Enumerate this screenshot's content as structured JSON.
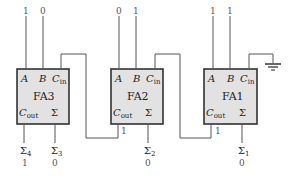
{
  "adders": [
    {
      "id": "FA3",
      "title": "FA3",
      "inputs": {
        "A": "1",
        "B": "0"
      },
      "pins": {
        "a": "A",
        "b": "B",
        "cin": "C",
        "cin_sub": "in",
        "cout": "C",
        "cout_sub": "out",
        "sum": "Σ"
      },
      "outputs": {
        "cout_label": "Σ",
        "cout_sub": "4",
        "cout_value": "1",
        "sum_label": "Σ",
        "sum_sub": "3",
        "sum_value": "0"
      }
    },
    {
      "id": "FA2",
      "title": "FA2",
      "inputs": {
        "A": "0",
        "B": "1"
      },
      "pins": {
        "a": "A",
        "b": "B",
        "cin": "C",
        "cin_sub": "in",
        "cout": "C",
        "cout_sub": "out",
        "sum": "Σ"
      },
      "outputs": {
        "carry_value": "1",
        "sum_label": "Σ",
        "sum_sub": "2",
        "sum_value": "0"
      }
    },
    {
      "id": "FA1",
      "title": "FA1",
      "inputs": {
        "A": "1",
        "B": "1"
      },
      "pins": {
        "a": "A",
        "b": "B",
        "cin": "C",
        "cin_sub": "in",
        "cout": "C",
        "cout_sub": "out",
        "sum": "Σ"
      },
      "outputs": {
        "carry_value": "1",
        "sum_label": "Σ",
        "sum_sub": "1",
        "sum_value": "0"
      }
    }
  ],
  "colors": {
    "box_fill": "#e2e2e2",
    "stroke": "#333333",
    "value_text": "#777777"
  }
}
